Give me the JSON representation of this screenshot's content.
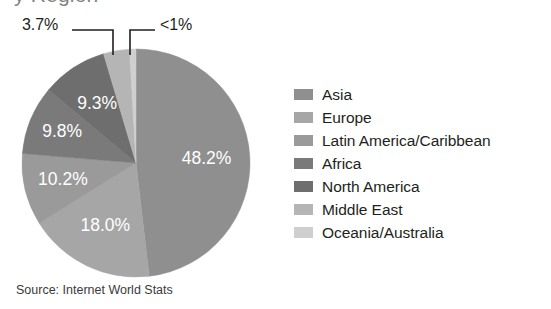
{
  "title_remnant": "y Region",
  "source_note": "Source: Internet World Stats",
  "callouts": {
    "left": {
      "label": "3.7%",
      "series": "Middle East"
    },
    "right": {
      "label": "<1%",
      "series": "Oceania/Australia"
    }
  },
  "legend": {
    "items": [
      {
        "label": "Asia",
        "color": "#8f8f8f"
      },
      {
        "label": "Europe",
        "color": "#a6a6a6"
      },
      {
        "label": "Latin America/Caribbean",
        "color": "#9a9a9a"
      },
      {
        "label": "Africa",
        "color": "#7a7a7a"
      },
      {
        "label": "North America",
        "color": "#6e6e6e"
      },
      {
        "label": "Middle East",
        "color": "#b5b5b5"
      },
      {
        "label": "Oceania/Australia",
        "color": "#cfcfcf"
      }
    ]
  },
  "chart_data": {
    "type": "pie",
    "xlabel": "",
    "ylabel": "",
    "legend_position": "right",
    "grid": false,
    "start_angle_deg": 0,
    "direction": "clockwise",
    "units": "percent of world internet users",
    "source": "Internet World Stats",
    "categories": [
      "Asia",
      "Europe",
      "Latin America/Caribbean",
      "Africa",
      "North America",
      "Middle East",
      "Oceania/Australia"
    ],
    "values": [
      48.2,
      18.0,
      10.2,
      9.8,
      9.3,
      3.7,
      0.9
    ],
    "data_labels": [
      "48.2%",
      "18.0%",
      "10.2%",
      "9.8%",
      "9.3%",
      "3.7%",
      "<1%"
    ],
    "colors": [
      "#8f8f8f",
      "#a6a6a6",
      "#9a9a9a",
      "#7a7a7a",
      "#6e6e6e",
      "#b5b5b5",
      "#cfcfcf"
    ],
    "label_placement": [
      "inside",
      "inside",
      "inside",
      "inside",
      "inside",
      "callout",
      "callout"
    ],
    "slices": [
      {
        "name": "Asia",
        "value": 48.2,
        "label": "48.2%",
        "color": "#8f8f8f"
      },
      {
        "name": "Europe",
        "value": 18.0,
        "label": "18.0%",
        "color": "#a6a6a6"
      },
      {
        "name": "Latin America/Caribbean",
        "value": 10.2,
        "label": "10.2%",
        "color": "#9a9a9a"
      },
      {
        "name": "Africa",
        "value": 9.8,
        "label": "9.8%",
        "color": "#7a7a7a"
      },
      {
        "name": "North America",
        "value": 9.3,
        "label": "9.3%",
        "color": "#6e6e6e"
      },
      {
        "name": "Middle East",
        "value": 3.7,
        "label": "3.7%",
        "color": "#b5b5b5"
      },
      {
        "name": "Oceania/Australia",
        "value": 0.9,
        "label": "<1%",
        "color": "#cfcfcf"
      }
    ]
  }
}
